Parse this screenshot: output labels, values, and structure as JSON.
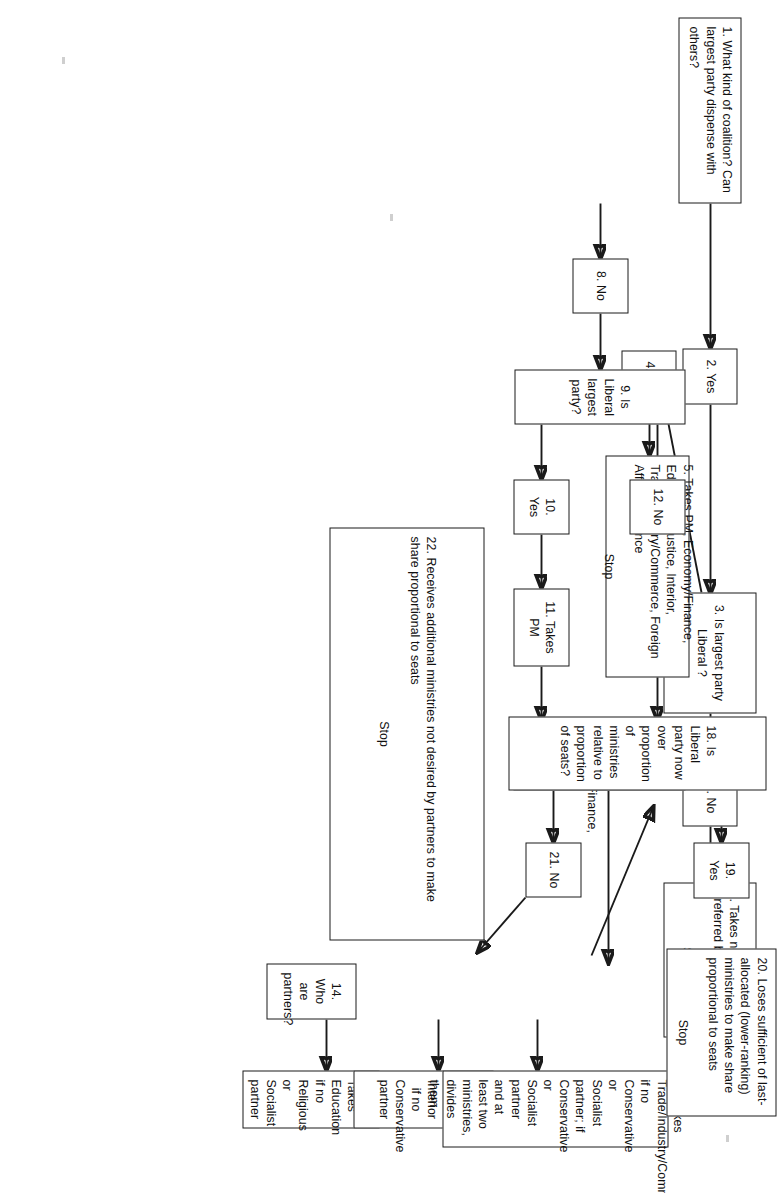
{
  "diagram": {
    "type": "flowchart",
    "title": "",
    "orientation": "page-rotated-90-clockwise",
    "nodes": [
      {
        "id": "n1",
        "number": "1.",
        "text": "What kind of coalition? Can largest party dispense with others?",
        "stop": ""
      },
      {
        "id": "n2",
        "number": "2.",
        "text": "Yes",
        "stop": ""
      },
      {
        "id": "n3",
        "number": "3.",
        "text": "Is largest party Liberal ?",
        "stop": ""
      },
      {
        "id": "n4",
        "number": "4.",
        "text": "Yes",
        "stop": ""
      },
      {
        "id": "n5",
        "number": "5.",
        "text": "Takes PM, Economy/Finance, Education, Justice, Interior, Trade/Industry/Commerce, Foreign Affairs, Defence",
        "stop": "Stop"
      },
      {
        "id": "n6",
        "number": "6.",
        "text": "No",
        "stop": ""
      },
      {
        "id": "n7",
        "number": "7.",
        "text": "Takes no ministry preferred by partner",
        "stop": "Stop"
      },
      {
        "id": "n8",
        "number": "8.",
        "text": "No",
        "stop": ""
      },
      {
        "id": "n9",
        "number": "9.",
        "text": "Is Liberal largest party?",
        "stop": ""
      },
      {
        "id": "n10",
        "number": "10.",
        "text": "Yes",
        "stop": ""
      },
      {
        "id": "n11",
        "number": "11.",
        "text": "Takes PM",
        "stop": ""
      },
      {
        "id": "n12",
        "number": "12.",
        "text": "No",
        "stop": ""
      },
      {
        "id": "n13",
        "number": "13.",
        "text": "Takes Economy/Finance, Justice",
        "stop": ""
      },
      {
        "id": "n14",
        "number": "14.",
        "text": "Who are partners?",
        "stop": ""
      },
      {
        "id": "n15",
        "number": "15.",
        "text": "Takes Education if no Religious or Socialist partner",
        "stop": ""
      },
      {
        "id": "n16",
        "number": "16.",
        "text": "Takes Interior if no Conservative partner",
        "stop": ""
      },
      {
        "id": "n17",
        "number": "17.",
        "text": "Takes Trade/Industry/Commerce if no Conservative or Socialist partner; if Conservative or Socialist partner and at least two ministries, divides them",
        "stop": ""
      },
      {
        "id": "n18",
        "number": "18.",
        "text": "Is Liberal party now over proportion of ministries relative to proportion of seats?",
        "stop": ""
      },
      {
        "id": "n19",
        "number": "19.",
        "text": "Yes",
        "stop": ""
      },
      {
        "id": "n20",
        "number": "20.",
        "text": "Loses sufficient of last-allocated (lower-ranking) ministries to make share proportional to seats",
        "stop": "Stop"
      },
      {
        "id": "n21",
        "number": "21.",
        "text": "No",
        "stop": ""
      },
      {
        "id": "n22",
        "number": "22.",
        "text": "Receives additional ministries not desired by partners to make share proportional to seats",
        "stop": "Stop"
      }
    ],
    "edges": [
      {
        "from": "n1",
        "to": "n2",
        "style": "straight"
      },
      {
        "from": "n2",
        "to": "n3",
        "style": "straight"
      },
      {
        "from": "n3",
        "to": "n4",
        "style": "diagonal"
      },
      {
        "from": "n4",
        "to": "n5",
        "style": "straight"
      },
      {
        "from": "n3",
        "to": "n6",
        "style": "straight"
      },
      {
        "from": "n6",
        "to": "n7",
        "style": "straight"
      },
      {
        "from": "n1",
        "to": "n8",
        "style": "straight"
      },
      {
        "from": "n8",
        "to": "n9",
        "style": "straight"
      },
      {
        "from": "n9",
        "to": "n10",
        "style": "straight"
      },
      {
        "from": "n10",
        "to": "n11",
        "style": "straight"
      },
      {
        "from": "n11",
        "to": "n13",
        "style": "straight"
      },
      {
        "from": "n9",
        "to": "n12",
        "style": "straight"
      },
      {
        "from": "n12",
        "to": "n13",
        "style": "straight"
      },
      {
        "from": "n13",
        "to": "n14",
        "style": "straight"
      },
      {
        "from": "n14",
        "to": "n15",
        "style": "straight"
      },
      {
        "from": "n15",
        "to": "n16",
        "style": "straight"
      },
      {
        "from": "n16",
        "to": "n17",
        "style": "straight"
      },
      {
        "from": "n17",
        "to": "n18",
        "style": "diagonal"
      },
      {
        "from": "n18",
        "to": "n19",
        "style": "straight"
      },
      {
        "from": "n19",
        "to": "n20",
        "style": "straight"
      },
      {
        "from": "n18",
        "to": "n21",
        "style": "straight"
      },
      {
        "from": "n21",
        "to": "n22",
        "style": "diagonal"
      }
    ],
    "colors": {
      "stroke": "#1a1a1a",
      "fill": "#ffffff",
      "text": "#111111",
      "page": "#ffffff"
    }
  }
}
